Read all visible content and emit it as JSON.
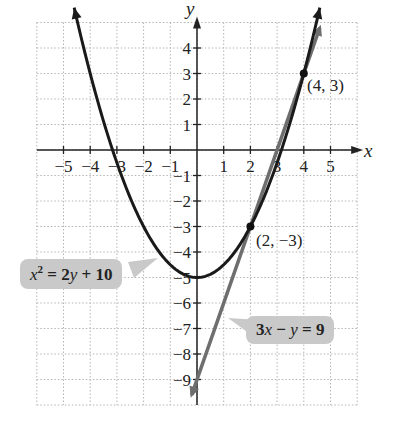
{
  "chart_data": {
    "type": "line",
    "title": "",
    "xlabel": "x",
    "ylabel": "y",
    "xlim": [
      -6,
      6
    ],
    "ylim": [
      -10,
      5
    ],
    "grid": true,
    "x_ticks": [
      -5,
      -4,
      -3,
      -2,
      -1,
      1,
      2,
      3,
      4,
      5
    ],
    "y_ticks": [
      4,
      3,
      2,
      1,
      -1,
      -2,
      -3,
      -4,
      -5,
      -6,
      -7,
      -8,
      -9
    ],
    "x_tick_labels": [
      "−5",
      "−4",
      "−3",
      "−2",
      "−1",
      "1",
      "2",
      "3",
      "4",
      "5"
    ],
    "y_tick_labels": [
      "4",
      "3",
      "2",
      "1",
      "−1",
      "−2",
      "−3",
      "−4",
      "−5",
      "−6",
      "−7",
      "−8",
      "−9"
    ],
    "series": [
      {
        "name": "x² = 2y + 10",
        "kind": "parabola",
        "equation": "y = (x^2 - 10)/2",
        "x_range": [
          -4.6,
          4.6
        ],
        "color": "#1a1a1a"
      },
      {
        "name": "3x − y = 9",
        "kind": "line",
        "equation": "y = 3x - 9",
        "x_range": [
          -0.2,
          4.6
        ],
        "color": "#6e6e6e"
      }
    ],
    "points": [
      {
        "x": 4,
        "y": 3,
        "label": "(4, 3)"
      },
      {
        "x": 2,
        "y": -3,
        "label": "(2, −3)"
      }
    ],
    "annotations": [
      {
        "text": "x² = 2y + 10",
        "target": "parabola"
      },
      {
        "text": "3x − y = 9",
        "target": "line"
      }
    ]
  },
  "labels": {
    "x_axis": "x",
    "y_axis": "y",
    "point1": "(4, 3)",
    "point2": "(2, −3)",
    "parabola_eq_var": "x",
    "parabola_eq_sup": "2",
    "parabola_eq_rest1": " = 2",
    "parabola_eq_y": "y",
    "parabola_eq_rest2": " + 10",
    "line_eq_3": "3",
    "line_eq_x": "x",
    "line_eq_minus": " − ",
    "line_eq_y": "y",
    "line_eq_rest": " = 9"
  }
}
